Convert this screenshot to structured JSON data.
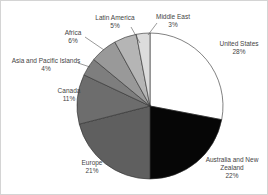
{
  "chart_data": {
    "type": "pie",
    "title": "",
    "unit": "percent",
    "categories": [
      "United States",
      "Australia and New Zealand",
      "Europe",
      "Canada",
      "Asia and Pacific Islands",
      "Africa",
      "Latin America",
      "Middle East"
    ],
    "values": [
      28,
      22,
      21,
      11,
      4,
      6,
      5,
      3
    ],
    "start_angle_deg": 0,
    "direction": "clockwise",
    "legend": "none",
    "background": "#ffffff",
    "stroke_color": "#2e2e2e",
    "center": {
      "x": 149,
      "y": 105
    },
    "radius": 73,
    "slices": [
      {
        "label": "United States",
        "value": 28,
        "pct_label": "28%",
        "color": "#ffffff",
        "label_lines": [
          "United States"
        ],
        "label_x": 238,
        "label_y": 45,
        "leader": null
      },
      {
        "label": "Australia and New Zealand",
        "value": 22,
        "pct_label": "22%",
        "color": "#060606",
        "label_lines": [
          "Australia and New",
          "Zealand"
        ],
        "label_x": 231,
        "label_y": 161,
        "leader": null
      },
      {
        "label": "Europe",
        "value": 21,
        "pct_label": "21%",
        "color": "#5f5f5f",
        "label_lines": [
          "Europe"
        ],
        "label_x": 91,
        "label_y": 164,
        "leader": null
      },
      {
        "label": "Canada",
        "value": 11,
        "pct_label": "11%",
        "color": "#6d6d6d",
        "label_lines": [
          "Canada"
        ],
        "label_x": 68,
        "label_y": 92,
        "leader": null
      },
      {
        "label": "Asia and Pacific Islands",
        "value": 4,
        "pct_label": "4%",
        "color": "#7e7e7e",
        "label_lines": [
          "Asia and Pacific Islands"
        ],
        "label_x": 45,
        "label_y": 62,
        "leader": {
          "x1": 77,
          "y1": 62,
          "x2": 89,
          "y2": 66
        }
      },
      {
        "label": "Africa",
        "value": 6,
        "pct_label": "6%",
        "color": "#999999",
        "label_lines": [
          "Africa"
        ],
        "label_x": 72,
        "label_y": 34,
        "leader": {
          "x1": 84,
          "y1": 36,
          "x2": 103,
          "y2": 49
        }
      },
      {
        "label": "Latin America",
        "value": 5,
        "pct_label": "5%",
        "color": "#b5b5b5",
        "label_lines": [
          "Latin America"
        ],
        "label_x": 114,
        "label_y": 19,
        "leader": {
          "x1": 130,
          "y1": 26,
          "x2": 139,
          "y2": 42
        }
      },
      {
        "label": "Middle East",
        "value": 3,
        "pct_label": "3%",
        "color": "#dcdcdc",
        "label_lines": [
          "Middle East"
        ],
        "label_x": 172,
        "label_y": 18,
        "leader": {
          "x1": 156,
          "y1": 22,
          "x2": 147,
          "y2": 34
        }
      }
    ]
  }
}
